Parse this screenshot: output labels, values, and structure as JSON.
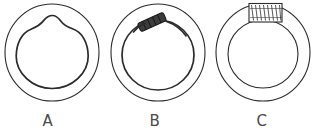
{
  "figure": {
    "type": "line-drawing",
    "background_color": "#ffffff",
    "stroke_color": "#2b2b2b",
    "label_color": "#4a4a4a",
    "caption_row_baseline_y": 126,
    "panels": [
      {
        "id": "A",
        "label": "A",
        "label_x": 48,
        "label_y": 126,
        "description": "annulus with irregular inner contour bearing a pointed bump at top",
        "outer": {
          "cx": 52,
          "cy": 52,
          "r": 47,
          "stroke_width": 1.1
        },
        "inner": {
          "cx": 52,
          "cy": 55,
          "r": 36,
          "stroke_width": 1.6,
          "deformation": "apex-bump-top-center"
        }
      },
      {
        "id": "B",
        "label": "B",
        "label_x": 155,
        "label_y": 126,
        "description": "annulus with small dark elongated lozenge lying across the inner ring at upper left",
        "outer": {
          "cx": 158,
          "cy": 52,
          "r": 47,
          "stroke_width": 1.1
        },
        "inner": {
          "cx": 158,
          "cy": 55,
          "r": 36,
          "stroke_width": 1.6
        },
        "marker": {
          "name": "dark-lozenge",
          "cx": 152,
          "cy": 22,
          "length": 28,
          "thickness": 9,
          "angle_deg": -24,
          "fill": "#3a3a3a",
          "hatched": true
        }
      },
      {
        "id": "C",
        "label": "C",
        "label_x": 262,
        "label_y": 126,
        "description": "clean concentric annulus with hatched rectangular block spanning the ring at top",
        "outer": {
          "cx": 263,
          "cy": 52,
          "r": 47,
          "stroke_width": 1.1
        },
        "inner": {
          "cx": 263,
          "cy": 54,
          "r": 35,
          "stroke_width": 1.1
        },
        "marker": {
          "name": "hatched-block",
          "x": 249,
          "y": 3,
          "width": 33,
          "height": 19,
          "fill": "#ffffff",
          "hatch": "zigzag-vertical",
          "hatch_count": 7
        }
      }
    ]
  }
}
